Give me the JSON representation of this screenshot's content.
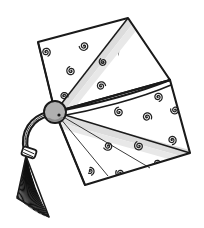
{
  "image": {
    "title": "Graduation Cap",
    "subject": "mortarboard-with-tassel",
    "style": "black-and-white line art illustration",
    "background_color": "#ffffff",
    "canvas": {
      "width": 204,
      "height": 228
    }
  },
  "palette": {
    "outline": "#1a1a1a",
    "fill_white": "#ffffff",
    "band_gray": "#dcdcdc",
    "band_gray_light": "#e8e8e8",
    "button_gray": "#b0b0b0",
    "button_shadow": "#8a8a8a",
    "tassel_dark": "#111111",
    "spiral_stroke": "#222222"
  },
  "parts": {
    "board_upper": {
      "label": "Upper board panel",
      "points": "128,18 38,42 55,112 170,80",
      "fill": "#ffffff"
    },
    "board_lower": {
      "label": "Lower board panel",
      "points": "55,112 170,80 190,153 85,185",
      "fill": "#ffffff"
    },
    "divider": {
      "label": "Center fold line across board",
      "path": "M55,112 C95,104 140,92 170,80"
    },
    "ribbon_upper": {
      "label": "Upper light ribbon band",
      "points": "55,112 128,18 134,22 62,114"
    },
    "ribbon_lower": {
      "label": "Lower light ribbon band",
      "points": "57,114 190,150 188,158 58,122"
    },
    "button": {
      "label": "Center button / knob",
      "cx": 55,
      "cy": 112,
      "r": 11,
      "fill": "#b0b0b0"
    },
    "cord": {
      "label": "Tassel cord",
      "path": "M48,114 C32,118 22,132 26,150"
    },
    "knot": {
      "label": "Tassel knot band",
      "x": 22,
      "y": 148,
      "width": 14,
      "height": 9
    },
    "tassel": {
      "label": "Tassel strands",
      "top": "26,156",
      "spread_left": 17,
      "spread_right": 49,
      "bottom_y": 213,
      "strand_count": 26
    }
  },
  "decorations": {
    "label": "Spiral swirl motifs",
    "count": 24,
    "spirals": [
      {
        "x": 46,
        "y": 52,
        "r": 4.6,
        "rot": 10
      },
      {
        "x": 84,
        "y": 46,
        "r": 4.8,
        "rot": 120
      },
      {
        "x": 71,
        "y": 71,
        "r": 4.6,
        "rot": 200
      },
      {
        "x": 122,
        "y": 55,
        "r": 4.8,
        "rot": 40
      },
      {
        "x": 101,
        "y": 86,
        "r": 4.6,
        "rot": 300
      },
      {
        "x": 135,
        "y": 81,
        "r": 4.6,
        "rot": 150
      },
      {
        "x": 149,
        "y": 51,
        "r": 4.4,
        "rot": 90
      },
      {
        "x": 136,
        "y": 22,
        "r": 4.2,
        "rot": 250
      },
      {
        "x": 158,
        "y": 97,
        "r": 4.6,
        "rot": 20
      },
      {
        "x": 119,
        "y": 112,
        "r": 4.8,
        "rot": 210
      },
      {
        "x": 93,
        "y": 127,
        "r": 4.6,
        "rot": 60
      },
      {
        "x": 147,
        "y": 117,
        "r": 4.8,
        "rot": 330
      },
      {
        "x": 175,
        "y": 110,
        "r": 4.4,
        "rot": 140
      },
      {
        "x": 172,
        "y": 140,
        "r": 4.6,
        "rot": 30
      },
      {
        "x": 139,
        "y": 146,
        "r": 4.8,
        "rot": 190
      },
      {
        "x": 108,
        "y": 146,
        "r": 4.6,
        "rot": 100
      },
      {
        "x": 80,
        "y": 148,
        "r": 4.6,
        "rot": 280
      },
      {
        "x": 90,
        "y": 171,
        "r": 4.4,
        "rot": 15
      },
      {
        "x": 120,
        "y": 173,
        "r": 4.4,
        "rot": 160
      },
      {
        "x": 68,
        "y": 129,
        "r": 4.4,
        "rot": 230
      },
      {
        "x": 160,
        "y": 66,
        "r": 4.2,
        "rot": 70
      },
      {
        "x": 103,
        "y": 62,
        "r": 4.0,
        "rot": 180
      },
      {
        "x": 64,
        "y": 96,
        "r": 4.0,
        "rot": 320
      },
      {
        "x": 157,
        "y": 163,
        "r": 4.0,
        "rot": 110
      }
    ]
  }
}
